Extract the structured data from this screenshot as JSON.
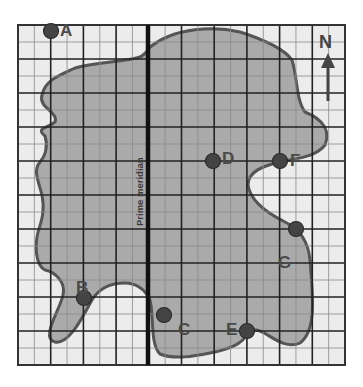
{
  "map": {
    "type": "grid-map",
    "grid": {
      "left": 18,
      "top": 25,
      "right": 345,
      "bottom": 365,
      "major_columns": 10,
      "major_rows": 10,
      "minor_per_major": 2,
      "background": "#ececec",
      "major_line_color": "#222222",
      "minor_line_color": "#8a8a8a"
    },
    "landmass": {
      "fill": "#aaaaaa",
      "stroke": "#555555"
    },
    "prime_meridian": {
      "label": "Prime meridian",
      "x": 148,
      "color": "#111111"
    },
    "compass": {
      "label": "N",
      "direction": "north"
    },
    "points": [
      {
        "id": "A",
        "label": "A",
        "x": 51,
        "y": 31,
        "lx": 60,
        "ly": 23
      },
      {
        "id": "B",
        "label": "B",
        "x": 84,
        "y": 298,
        "lx": 76,
        "ly": 280
      },
      {
        "id": "C",
        "label": "C",
        "x": 164,
        "y": 315,
        "lx": 178,
        "ly": 322
      },
      {
        "id": "D",
        "label": "D",
        "x": 213,
        "y": 161,
        "lx": 222,
        "ly": 151
      },
      {
        "id": "E",
        "label": "E",
        "x": 247,
        "y": 331,
        "lx": 226,
        "ly": 322
      },
      {
        "id": "F",
        "label": "F",
        "x": 280,
        "y": 161,
        "lx": 290,
        "ly": 153
      },
      {
        "id": "G",
        "label": "G",
        "x": 296,
        "y": 229,
        "lx": 278,
        "ly": 255
      }
    ],
    "point_color": "#444444"
  }
}
